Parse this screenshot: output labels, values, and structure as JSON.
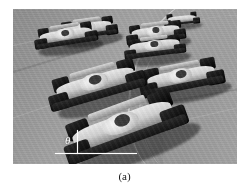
{
  "figure": {
    "caption": "(a)",
    "photo": {
      "subject": "open-wheel race cars on a banked oval track",
      "color_mode": "grayscale",
      "background_color": "#9a9a9a",
      "frame": {
        "x": 13,
        "y": 9,
        "width": 224,
        "height": 155
      }
    },
    "annotation": {
      "symbol": "θ",
      "symbol_label": "theta",
      "line_color": "#ffffff",
      "horizontal_line_label": "horizontal reference line",
      "vertical_line_label": "vertical reference line",
      "meaning": "bank / steering angle of the lead car"
    },
    "cars": [
      {
        "id": "car-lead",
        "label": "lead car foreground",
        "rotation_deg": -20
      },
      {
        "id": "car-second",
        "label": "second car",
        "rotation_deg": -16
      },
      {
        "id": "car-right",
        "label": "right mid-field car",
        "rotation_deg": -11
      },
      {
        "id": "car-bg-l1",
        "label": "background car left front",
        "rotation_deg": -9
      },
      {
        "id": "car-bg-l2",
        "label": "background car left rear",
        "rotation_deg": -8
      },
      {
        "id": "car-bg-r1",
        "label": "background car right front",
        "rotation_deg": -7
      },
      {
        "id": "car-bg-r2",
        "label": "background car right rear",
        "rotation_deg": -7
      },
      {
        "id": "car-bg-far",
        "label": "distant car",
        "rotation_deg": -6
      }
    ],
    "page_background": "#ffffff"
  }
}
